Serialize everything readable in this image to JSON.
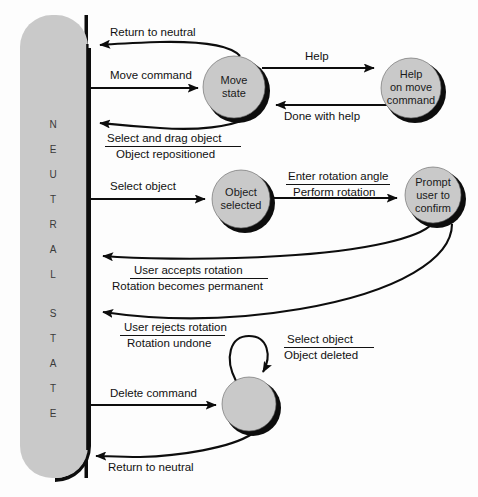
{
  "diagram": {
    "background_color": "#fdfdfd",
    "state_fill_color": "#c9c9c9",
    "line_color": "#0d0d0d",
    "neutral": {
      "name": "neutral-state-bar",
      "letters": [
        "N",
        "E",
        "U",
        "T",
        "R",
        "A",
        "L",
        "",
        "S",
        "T",
        "A",
        "T",
        "E"
      ],
      "full_label": "NEUTRAL STATE"
    },
    "states": [
      {
        "id": "move-state",
        "line1": "Move",
        "line2": "state",
        "line3": ""
      },
      {
        "id": "help-state",
        "line1": "Help",
        "line2": "on move",
        "line3": "command"
      },
      {
        "id": "object-selected-state",
        "line1": "Object",
        "line2": "selected",
        "line3": ""
      },
      {
        "id": "prompt-confirm-state",
        "line1": "Prompt",
        "line2": "user to",
        "line3": "confirm"
      },
      {
        "id": "delete-state",
        "line1": "",
        "line2": "",
        "line3": ""
      }
    ],
    "transitions": [
      {
        "id": "t-return-to-neutral-move",
        "event": "Return to neutral",
        "action": "",
        "divider": false
      },
      {
        "id": "t-move-command",
        "event": "Move command",
        "action": "",
        "divider": false
      },
      {
        "id": "t-help",
        "event": "Help",
        "action": "",
        "divider": false
      },
      {
        "id": "t-done-with-help",
        "event": "Done with help",
        "action": "",
        "divider": false
      },
      {
        "id": "t-select-and-drag",
        "event": "Select and drag object",
        "action": "Object repositioned",
        "divider": true
      },
      {
        "id": "t-select-object",
        "event": "Select object",
        "action": "",
        "divider": false
      },
      {
        "id": "t-enter-rotation-angle",
        "event": "Enter rotation angle",
        "action": "Perform rotation",
        "divider": true
      },
      {
        "id": "t-user-accepts-rotation",
        "event": "User accepts rotation",
        "action": "Rotation becomes permanent",
        "divider": true
      },
      {
        "id": "t-user-rejects-rotation",
        "event": "User rejects rotation",
        "action": "Rotation undone",
        "divider": true
      },
      {
        "id": "t-select-object-delete",
        "event": "Select object",
        "action": "Object deleted",
        "divider": true
      },
      {
        "id": "t-delete-command",
        "event": "Delete command",
        "action": "",
        "divider": false
      },
      {
        "id": "t-return-to-neutral-delete",
        "event": "Return to neutral",
        "action": "",
        "divider": false
      }
    ]
  }
}
